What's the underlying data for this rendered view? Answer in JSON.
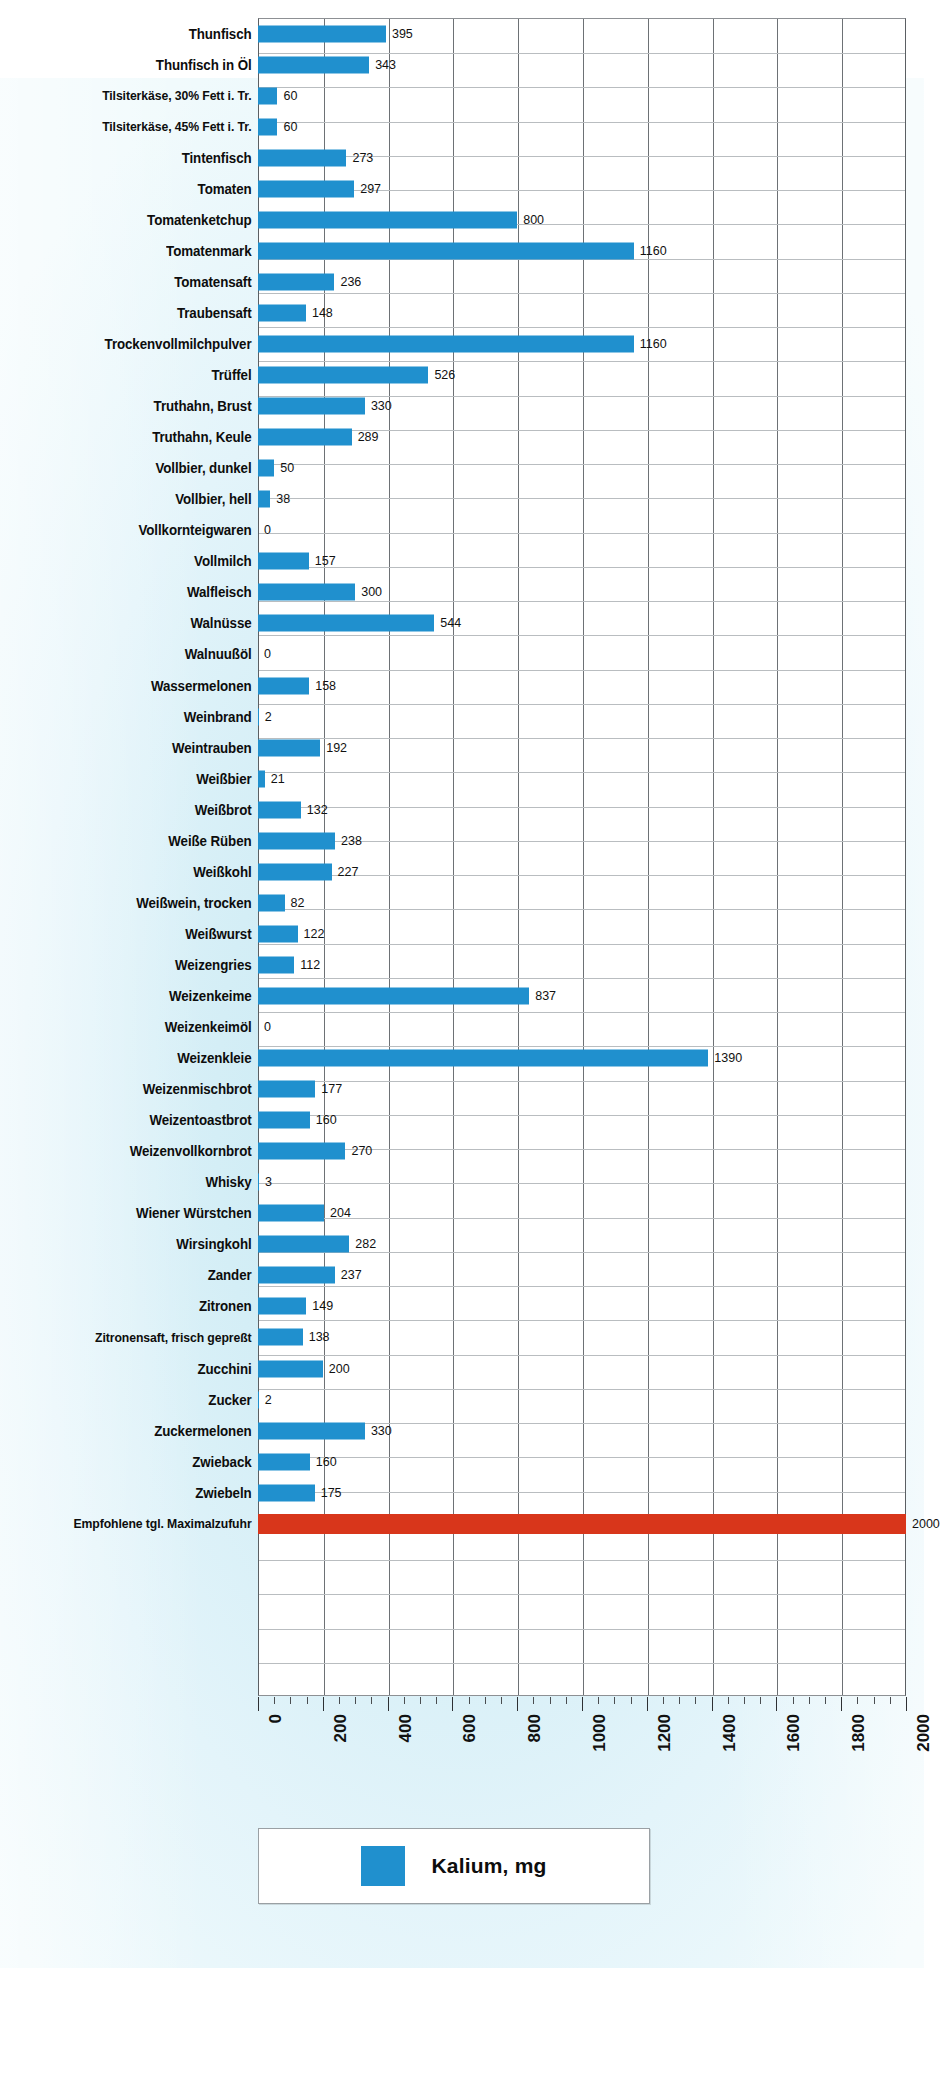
{
  "chart_data": {
    "type": "bar",
    "orientation": "horizontal",
    "title": "",
    "xlabel": "",
    "ylabel": "",
    "xlim": [
      0,
      2000
    ],
    "xticks": [
      0,
      200,
      400,
      600,
      800,
      1000,
      1200,
      1400,
      1600,
      1800,
      2000
    ],
    "xtick_labels": [
      "0",
      "200",
      "400",
      "600",
      "800",
      "1000",
      "1200",
      "1400",
      "1600",
      "1800",
      "2000"
    ],
    "grid": true,
    "minor_ticks_per_interval": 4,
    "legend": {
      "position": "bottom",
      "entries": [
        {
          "label": "Kalium, mg",
          "color": "#2090ce"
        }
      ]
    },
    "series_color": "#2090ce",
    "reference_color": "#d8361b",
    "categories": [
      "Thunfisch",
      "Thunfisch in Öl",
      "Tilsiterkäse, 30% Fett i. Tr.",
      "Tilsiterkäse, 45% Fett i. Tr.",
      "Tintenfisch",
      "Tomaten",
      "Tomatenketchup",
      "Tomatenmark",
      "Tomatensaft",
      "Traubensaft",
      "Trockenvollmilchpulver",
      "Trüffel",
      "Truthahn, Brust",
      "Truthahn, Keule",
      "Vollbier, dunkel",
      "Vollbier, hell",
      "Vollkornteigwaren",
      "Vollmilch",
      "Walfleisch",
      "Walnüsse",
      "Walnuußöl",
      "Wassermelonen",
      "Weinbrand",
      "Weintrauben",
      "Weißbier",
      "Weißbrot",
      "Weiße Rüben",
      "Weißkohl",
      "Weißwein, trocken",
      "Weißwurst",
      "Weizengries",
      "Weizenkeime",
      "Weizenkeimöl",
      "Weizenkleie",
      "Weizenmischbrot",
      "Weizentoastbrot",
      "Weizenvollkornbrot",
      "Whisky",
      "Wiener Würstchen",
      "Wirsingkohl",
      "Zander",
      "Zitronen",
      "Zitronensaft, frisch gepreßt",
      "Zucchini",
      "Zucker",
      "Zuckermelonen",
      "Zwieback",
      "Zwiebeln",
      "Empfohlene tgl. Maximalzufuhr"
    ],
    "values": [
      395,
      343,
      60,
      60,
      273,
      297,
      800,
      1160,
      236,
      148,
      1160,
      526,
      330,
      289,
      50,
      38,
      0,
      157,
      300,
      544,
      0,
      158,
      2,
      192,
      21,
      132,
      238,
      227,
      82,
      122,
      112,
      837,
      0,
      1390,
      177,
      160,
      270,
      3,
      204,
      282,
      237,
      149,
      138,
      200,
      2,
      330,
      160,
      175,
      2000
    ],
    "value_labels": [
      "395",
      "343",
      "60",
      "60",
      "273",
      "297",
      "800",
      "1160",
      "236",
      "148",
      "1160",
      "526",
      "330",
      "289",
      "50",
      "38",
      "0",
      "157",
      "300",
      "544",
      "0",
      "158",
      "2",
      "192",
      "21",
      "132",
      "238",
      "227",
      "82",
      "122",
      "112",
      "837",
      "0",
      "1390",
      "177",
      "160",
      "270",
      "3",
      "204",
      "282",
      "237",
      "149",
      "138",
      "200",
      "2",
      "330",
      "160",
      "175",
      "2000"
    ],
    "reference_row_index": 48
  }
}
